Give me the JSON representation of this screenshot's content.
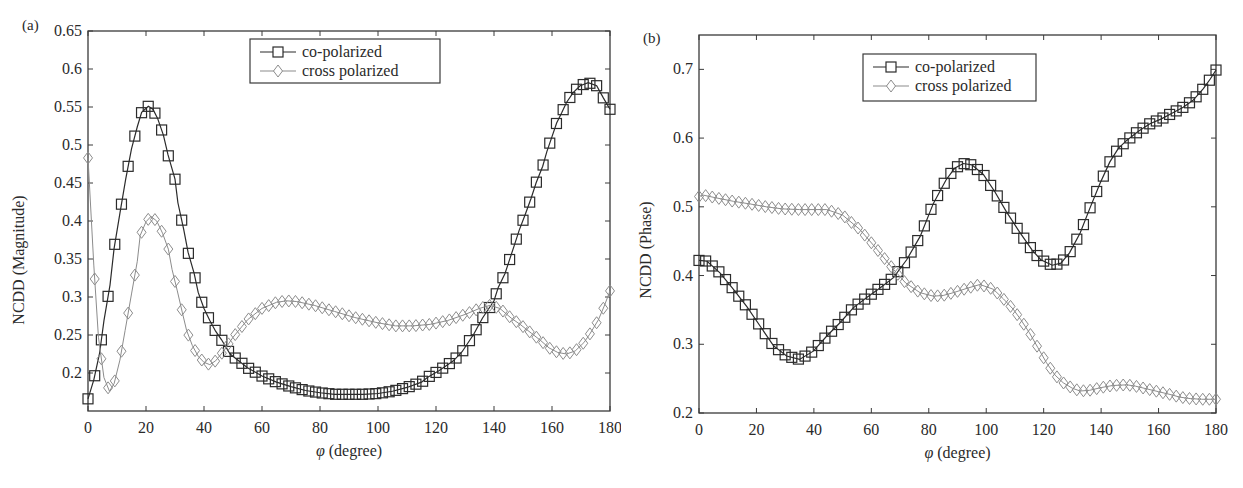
{
  "chart_data": [
    {
      "type": "line",
      "panel_label": "(a)",
      "title": "",
      "xlabel": "φ (degree)",
      "ylabel": "NCDD (Magnitude)",
      "xlim": [
        0,
        180
      ],
      "ylim": [
        0.15,
        0.65
      ],
      "xticks": [
        0,
        20,
        40,
        60,
        80,
        100,
        120,
        140,
        160,
        180
      ],
      "yticks": [
        0.2,
        0.25,
        0.3,
        0.35,
        0.4,
        0.45,
        0.5,
        0.55,
        0.6,
        0.65
      ],
      "ytick_labels": [
        "0.2",
        "0.25",
        "0.3",
        "0.35",
        "0.4",
        "0.45",
        "0.5",
        "0.55",
        "0.6",
        "0.65"
      ],
      "grid": false,
      "legend_position": "upper center",
      "series": [
        {
          "name": "co-polarized",
          "marker": "square",
          "color": "#2b2b2b",
          "x": [
            0,
            2,
            4,
            5.5,
            7.6,
            9,
            11,
            13,
            15,
            17,
            18.5,
            20.8,
            22.4,
            24,
            26,
            27.6,
            30,
            31,
            33,
            34.5,
            36.6,
            38,
            40,
            42,
            44,
            46,
            49,
            55,
            60,
            65,
            70,
            75,
            80,
            85,
            89,
            95,
            100,
            105,
            110,
            115,
            117,
            121,
            126,
            129,
            133,
            136,
            140,
            141.5,
            143.8,
            147,
            148.7,
            150.7,
            152.8,
            154.5,
            156.8,
            158.2,
            160,
            161.6,
            163.3,
            165,
            167.3,
            169.7,
            172.5,
            175.4,
            177.7,
            180
          ],
          "y": [
            0.166,
            0.191,
            0.226,
            0.269,
            0.316,
            0.364,
            0.41,
            0.455,
            0.495,
            0.524,
            0.543,
            0.551,
            0.547,
            0.535,
            0.513,
            0.487,
            0.455,
            0.424,
            0.389,
            0.359,
            0.331,
            0.306,
            0.285,
            0.269,
            0.255,
            0.244,
            0.225,
            0.207,
            0.196,
            0.188,
            0.182,
            0.177,
            0.174,
            0.172,
            0.172,
            0.172,
            0.173,
            0.176,
            0.181,
            0.188,
            0.194,
            0.203,
            0.216,
            0.228,
            0.251,
            0.272,
            0.295,
            0.313,
            0.331,
            0.368,
            0.388,
            0.408,
            0.43,
            0.45,
            0.472,
            0.491,
            0.511,
            0.529,
            0.542,
            0.556,
            0.569,
            0.578,
            0.582,
            0.578,
            0.562,
            0.547
          ]
        },
        {
          "name": "cross polarized",
          "marker": "diamond",
          "color": "#8c8c8c",
          "x": [
            0,
            2,
            3.6,
            5.5,
            7.4,
            9,
            11,
            12.8,
            15,
            17,
            18,
            20,
            21.7,
            23.7,
            25.7,
            27.7,
            29,
            30.8,
            32.5,
            34,
            36,
            38,
            40,
            42,
            44,
            47,
            50,
            55,
            60,
            65,
            68.5,
            72,
            78,
            85,
            92,
            100,
            106,
            112,
            118,
            124,
            130,
            135,
            138.6,
            142,
            146,
            149,
            153,
            156,
            159,
            162,
            165,
            168,
            171,
            173,
            176,
            178,
            180
          ],
          "y": [
            0.483,
            0.342,
            0.247,
            0.194,
            0.176,
            0.186,
            0.217,
            0.256,
            0.304,
            0.347,
            0.381,
            0.399,
            0.406,
            0.4,
            0.384,
            0.363,
            0.336,
            0.308,
            0.28,
            0.256,
            0.236,
            0.222,
            0.214,
            0.211,
            0.216,
            0.23,
            0.247,
            0.27,
            0.285,
            0.293,
            0.295,
            0.294,
            0.289,
            0.281,
            0.273,
            0.266,
            0.262,
            0.262,
            0.264,
            0.269,
            0.277,
            0.285,
            0.289,
            0.285,
            0.272,
            0.264,
            0.252,
            0.243,
            0.233,
            0.227,
            0.225,
            0.229,
            0.24,
            0.251,
            0.27,
            0.288,
            0.308
          ]
        }
      ]
    },
    {
      "type": "line",
      "panel_label": "(b)",
      "title": "",
      "xlabel": "φ (degree)",
      "ylabel": "NCDD (Phase)",
      "xlim": [
        0,
        180
      ],
      "ylim": [
        0.2,
        0.75
      ],
      "xticks": [
        0,
        20,
        40,
        60,
        80,
        100,
        120,
        140,
        160,
        180
      ],
      "yticks": [
        0.2,
        0.3,
        0.4,
        0.5,
        0.6,
        0.7
      ],
      "ytick_labels": [
        "0.2",
        "0.3",
        "0.4",
        "0.5",
        "0.6",
        "0.7"
      ],
      "grid": false,
      "legend_position": "upper center-right",
      "series": [
        {
          "name": "co-polarized",
          "marker": "square",
          "color": "#2b2b2b",
          "x": [
            0,
            2.7,
            7.3,
            12,
            16.6,
            21.2,
            25.9,
            30.5,
            35,
            39.8,
            44.5,
            49,
            53.7,
            58.4,
            63,
            67.7,
            72.3,
            77,
            81.6,
            86,
            89,
            92,
            95,
            99,
            103,
            107,
            111.8,
            116,
            119,
            123,
            126,
            129,
            132.7,
            136,
            139.6,
            143,
            146,
            149,
            153,
            157,
            161,
            165,
            168.6,
            172,
            175.6,
            178,
            180
          ],
          "y": [
            0.422,
            0.421,
            0.404,
            0.38,
            0.355,
            0.327,
            0.298,
            0.283,
            0.278,
            0.29,
            0.312,
            0.331,
            0.353,
            0.368,
            0.382,
            0.397,
            0.423,
            0.457,
            0.505,
            0.539,
            0.556,
            0.563,
            0.561,
            0.547,
            0.522,
            0.493,
            0.462,
            0.437,
            0.423,
            0.415,
            0.418,
            0.433,
            0.462,
            0.497,
            0.534,
            0.565,
            0.585,
            0.597,
            0.61,
            0.621,
            0.628,
            0.637,
            0.645,
            0.655,
            0.672,
            0.686,
            0.699
          ]
        },
        {
          "name": "cross polarized",
          "marker": "diamond",
          "color": "#8c8c8c",
          "x": [
            0,
            1.5,
            6,
            12,
            18,
            23.5,
            29,
            35,
            40,
            44.5,
            50,
            56,
            62,
            67.7,
            72,
            77,
            81.6,
            85,
            88.5,
            93,
            97.8,
            102.5,
            106,
            109.4,
            112,
            115,
            118,
            121,
            124,
            126.8,
            130,
            132.7,
            136,
            140,
            144,
            149,
            152,
            156,
            160,
            164,
            167.5,
            171,
            175,
            179,
            180
          ],
          "y": [
            0.515,
            0.517,
            0.513,
            0.508,
            0.504,
            0.5,
            0.497,
            0.496,
            0.496,
            0.496,
            0.488,
            0.467,
            0.438,
            0.409,
            0.389,
            0.375,
            0.37,
            0.371,
            0.375,
            0.381,
            0.387,
            0.38,
            0.366,
            0.351,
            0.336,
            0.317,
            0.295,
            0.273,
            0.255,
            0.244,
            0.236,
            0.232,
            0.233,
            0.237,
            0.24,
            0.241,
            0.239,
            0.235,
            0.231,
            0.227,
            0.223,
            0.221,
            0.22,
            0.22,
            0.22
          ]
        }
      ]
    }
  ],
  "panels": [
    {
      "label": "(a)",
      "xlabel_prefix": "φ",
      "xlabel_suffix": " (degree)",
      "ylabel": "NCDD (Magnitude)",
      "legend": [
        "co-polarized",
        "cross polarized"
      ]
    },
    {
      "label": "(b)",
      "xlabel_prefix": "φ",
      "xlabel_suffix": " (degree)",
      "ylabel": "NCDD (Phase)",
      "legend": [
        "co-polarized",
        "cross polarized"
      ]
    }
  ]
}
